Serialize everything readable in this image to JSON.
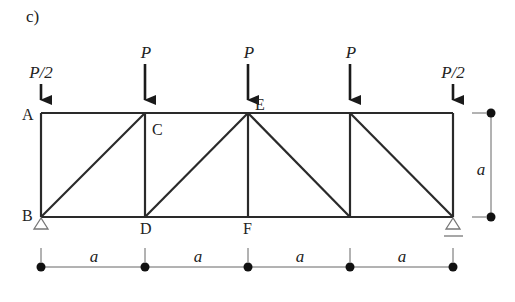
{
  "figure_label": "c)",
  "colors": {
    "member": "#2a2a2a",
    "dimension": "#555555",
    "text": "#222222"
  },
  "nodes": [
    {
      "id": "A",
      "label": "A",
      "x": 41,
      "y": 113
    },
    {
      "id": "B",
      "label": "B",
      "x": 41,
      "y": 217
    },
    {
      "id": "C",
      "label": "C",
      "x": 145,
      "y": 113
    },
    {
      "id": "D",
      "label": "D",
      "x": 145,
      "y": 217
    },
    {
      "id": "E",
      "label": "E",
      "x": 248,
      "y": 113
    },
    {
      "id": "F",
      "label": "F",
      "x": 248,
      "y": 217
    },
    {
      "id": "G",
      "label": "",
      "x": 350,
      "y": 113
    },
    {
      "id": "H",
      "label": "",
      "x": 350,
      "y": 217
    },
    {
      "id": "I",
      "label": "",
      "x": 453,
      "y": 113
    },
    {
      "id": "J",
      "label": "",
      "x": 453,
      "y": 217
    }
  ],
  "members": [
    [
      "A",
      "C"
    ],
    [
      "C",
      "E"
    ],
    [
      "E",
      "G"
    ],
    [
      "G",
      "I"
    ],
    [
      "B",
      "D"
    ],
    [
      "D",
      "F"
    ],
    [
      "F",
      "H"
    ],
    [
      "H",
      "J"
    ],
    [
      "A",
      "B"
    ],
    [
      "C",
      "D"
    ],
    [
      "E",
      "F"
    ],
    [
      "G",
      "H"
    ],
    [
      "I",
      "J"
    ],
    [
      "B",
      "C"
    ],
    [
      "D",
      "E"
    ],
    [
      "E",
      "H"
    ],
    [
      "G",
      "J"
    ]
  ],
  "loads": [
    {
      "node": "A",
      "label": "P/2"
    },
    {
      "node": "C",
      "label": "P"
    },
    {
      "node": "E",
      "label": "P"
    },
    {
      "node": "G",
      "label": "P"
    },
    {
      "node": "I",
      "label": "P/2"
    }
  ],
  "supports": [
    {
      "node": "B",
      "type": "pin"
    },
    {
      "node": "J",
      "type": "roller"
    }
  ],
  "dimensions": {
    "horizontal": {
      "labels": [
        "a",
        "a",
        "a",
        "a"
      ]
    },
    "vertical": {
      "label": "a"
    }
  }
}
